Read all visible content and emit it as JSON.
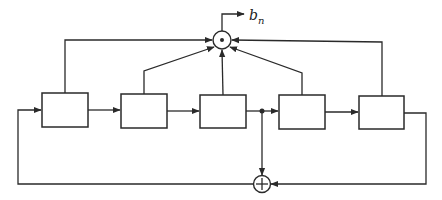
{
  "diagram": {
    "title": "",
    "output": {
      "symbol": "b",
      "subscript": "n"
    },
    "stages": [
      {
        "id": "stage-1",
        "label": ""
      },
      {
        "id": "stage-2",
        "label": ""
      },
      {
        "id": "stage-3",
        "label": ""
      },
      {
        "id": "stage-4",
        "label": ""
      },
      {
        "id": "stage-5",
        "label": ""
      }
    ],
    "multiplier_node": {
      "symbol": "•"
    },
    "xor_node": {
      "symbol": "+"
    }
  },
  "colors": {
    "line": "#2a2a2a",
    "background": "#ffffff"
  }
}
